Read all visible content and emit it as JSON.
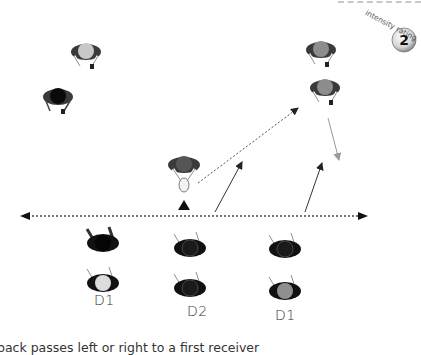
{
  "intensity": {
    "label": "intensity rating",
    "value": "2"
  },
  "labels": {
    "d1_left": "D1",
    "d2_center": "D2",
    "d1_right": "D1"
  },
  "caption": "back passes left or right to a first receiver",
  "colors": {
    "attacker_head": "#9a9a9a",
    "attacker_light_head": "#c8c8c8",
    "defender_body": "#111111",
    "dark_shoulders": "#3a3a3a",
    "arrow": "#333333",
    "grey_arrow": "#888888"
  },
  "players": [
    {
      "role": "attacker",
      "x": 86,
      "y": 52,
      "head": "light"
    },
    {
      "role": "attacker",
      "x": 58,
      "y": 97,
      "head": "dark"
    },
    {
      "role": "ball-carrier",
      "x": 184,
      "y": 165,
      "head": "grey"
    },
    {
      "role": "attacker",
      "x": 321,
      "y": 50,
      "head": "grey"
    },
    {
      "role": "attacker",
      "x": 325,
      "y": 88,
      "head": "grey"
    },
    {
      "role": "defender",
      "x": 103,
      "y": 243,
      "head": "dark"
    },
    {
      "role": "defender",
      "x": 103,
      "y": 283,
      "head": "light"
    },
    {
      "role": "defender",
      "x": 190,
      "y": 248,
      "head": "dark"
    },
    {
      "role": "defender",
      "x": 190,
      "y": 288,
      "head": "dark"
    },
    {
      "role": "defender",
      "x": 285,
      "y": 249,
      "head": "dark"
    },
    {
      "role": "defender",
      "x": 285,
      "y": 291,
      "head": "grey"
    }
  ]
}
